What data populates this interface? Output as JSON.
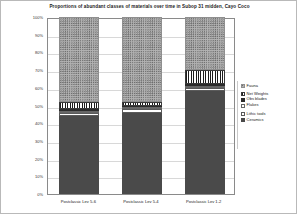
{
  "chart_data": {
    "type": "bar",
    "title": "Proportions of abundant classes of materials over time in Subop 31 midden, Cayo Coco",
    "xlabel": "",
    "ylabel": "",
    "ylim": [
      0,
      100
    ],
    "stacked": true,
    "percent": true,
    "grid": true,
    "legend_position": "right",
    "categories": [
      "Postclassic Lev 5-6",
      "Postclassic Lev 5-4",
      "Postclassic Lev 1-2"
    ],
    "ytick_labels": [
      "0%",
      "10%",
      "20%",
      "30%",
      "40%",
      "50%",
      "60%",
      "70%",
      "80%",
      "90%",
      "100%"
    ],
    "ytick_values": [
      0,
      10,
      20,
      30,
      40,
      50,
      60,
      70,
      80,
      90,
      100
    ],
    "series": [
      {
        "name": "Ceramics",
        "key": "ceramics",
        "color": "#4a4a4a",
        "values": [
          44,
          46,
          58
        ]
      },
      {
        "name": "Lithic tools",
        "key": "lithic",
        "color": "#ffffff",
        "values": [
          2,
          2,
          2
        ]
      },
      {
        "name": "Flakes",
        "key": "flakes",
        "color": "#ffffff",
        "values": [
          1,
          1,
          1
        ]
      },
      {
        "name": "Obs blades",
        "key": "obsidian",
        "color": "#2b2b2b",
        "values": [
          1,
          1,
          1
        ]
      },
      {
        "name": "Net Weights",
        "key": "netweights",
        "color": "#ffffff",
        "values": [
          4,
          2,
          8
        ]
      },
      {
        "name": "Fauna",
        "key": "fauna",
        "color": "#b2b2b2",
        "values": [
          48,
          48,
          30
        ]
      }
    ]
  },
  "legend": {
    "items": [
      {
        "label": "Fauna",
        "swatch": "p-fauna"
      },
      {
        "label": "Net Weights",
        "swatch": "p-netweights"
      },
      {
        "label": "Obs blades",
        "swatch": "p-obsidian"
      },
      {
        "label": "Flakes",
        "swatch": "p-flakes"
      },
      {
        "label": "Lithic tools",
        "swatch": "p-lithic"
      },
      {
        "label": "Ceramics",
        "swatch": "p-ceramics"
      }
    ]
  }
}
